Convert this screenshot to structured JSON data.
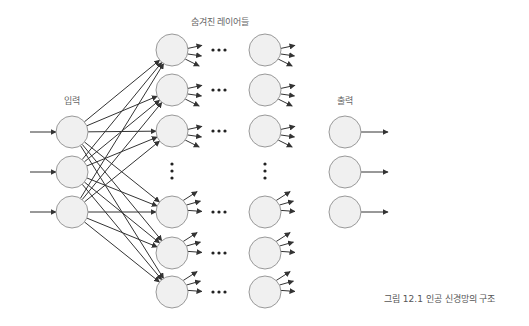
{
  "labels": {
    "input": "입력",
    "hidden": "숨겨진 레이어들",
    "output": "출력",
    "caption": "그림 12.1 인공 신경망의 구조"
  },
  "colors": {
    "node_fill": "#f0f0f0",
    "node_stroke": "#999999",
    "edge": "#333333",
    "label": "#666666"
  },
  "layers": {
    "input": {
      "x": 72,
      "ys": [
        132,
        172,
        212
      ]
    },
    "hidden1": {
      "x": 172,
      "ys": [
        50,
        90,
        131,
        212,
        253,
        292
      ]
    },
    "hidden2": {
      "x": 265,
      "ys": [
        50,
        90,
        131,
        212,
        253,
        292
      ]
    },
    "output": {
      "x": 345,
      "ys": [
        132,
        172,
        212
      ]
    }
  },
  "node_radius": 16,
  "ellipsis": {
    "horizontal": "•••",
    "vertical": "⋮"
  }
}
